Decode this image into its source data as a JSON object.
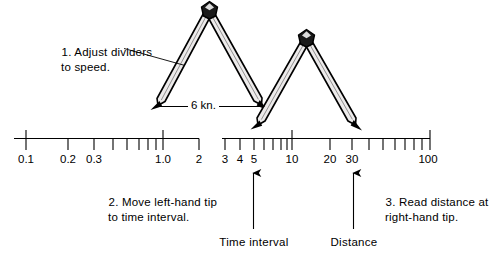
{
  "figure": {
    "background_color": "#ffffff",
    "ink_color": "#000000",
    "divider_fill": "#e8e8e8"
  },
  "annotations": {
    "step1": {
      "line1": "1. Adjust dividers",
      "line2": "to speed."
    },
    "step2": {
      "line1": "2. Move left-hand tip",
      "line2": "to time interval."
    },
    "step3": {
      "line1": "3. Read distance at",
      "line2": "right-hand tip."
    },
    "speed_label": "6 kn.",
    "time_interval_caption": "Time interval",
    "distance_caption": "Distance"
  },
  "scale": {
    "left_segment": {
      "labels": [
        {
          "text": "0.1",
          "x": 26
        },
        {
          "text": "0.2",
          "x": 68
        },
        {
          "text": "0.3",
          "x": 94
        },
        {
          "text": "1.0",
          "x": 163
        },
        {
          "text": "2",
          "x": 199
        }
      ]
    },
    "right_segment": {
      "labels": [
        {
          "text": "3",
          "x": 225
        },
        {
          "text": "4",
          "x": 240
        },
        {
          "text": "5",
          "x": 254
        },
        {
          "text": "10",
          "x": 292
        },
        {
          "text": "20",
          "x": 330
        },
        {
          "text": "30",
          "x": 352
        },
        {
          "text": "100",
          "x": 428
        }
      ]
    }
  },
  "pointers": {
    "time_interval_value": "5",
    "distance_value": "30"
  }
}
